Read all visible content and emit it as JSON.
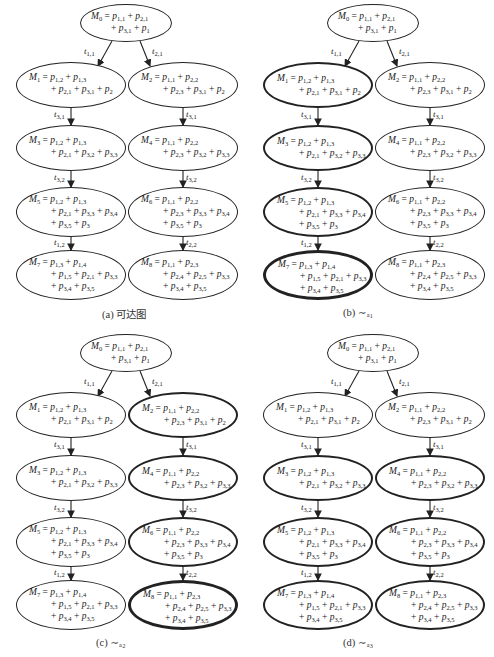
{
  "nodes": {
    "M0": {
      "line1": "M₀ = p₁,₁ + p₂,₁",
      "line2": "+ p₃,₁ + p₁"
    },
    "M1": {
      "line1": "M₁ = p₁,₂ + p₁,₃",
      "line2": "+ p₂,₁ + p₃,₁ + p₂"
    },
    "M2": {
      "line1": "M₂ = p₁,₁ + p₂,₂",
      "line2": "+ p₂,₃ + p₃,₁ + p₂"
    },
    "M3": {
      "line1": "M₃ = p₁,₂ + p₁,₃",
      "line2": "+ p₂,₁ + p₃,₂ + p₃,₃"
    },
    "M4": {
      "line1": "M₄ = p₁,₁ + p₂,₂",
      "line2": "+ p₂,₃ + p₃,₂ + p₃,₃"
    },
    "M5": {
      "line1": "M₅ = p₁,₂ + p₁,₃",
      "line2": "+ p₂,₁ + p₃,₃ + p₃,₄",
      "line3": "+ p₃,₅ + p₃"
    },
    "M6": {
      "line1": "M₆ = p₁,₁ + p₂,₂",
      "line2": "+ p₂,₃ + p₃,₃ + p₃,₄",
      "line3": "+ p₃,₅ + p₃"
    },
    "M7": {
      "line1": "M₇ = p₁,₃ + p₁,₄",
      "line2": "+ p₁,₅ + p₂,₁ + p₃,₃",
      "line3": "+ p₃,₄ + p₃,₅"
    },
    "M8": {
      "line1": "M₈ = p₁,₁ + p₂,₃",
      "line2": "+ p₂,₄ + p₂,₅ + p₃,₃",
      "line3": "+ p₃,₄ + p₃,₅"
    }
  },
  "edges": {
    "e01": "t₁,₁",
    "e02": "t₂,₁",
    "e13": "t₃,₁",
    "e24": "t₃,₁",
    "e35": "t₃,₂",
    "e46": "t₃,₂",
    "e57": "t₁,₂",
    "e68": "t₂,₂"
  },
  "panels": [
    {
      "id": "a",
      "caption": "(a) 可达图",
      "bold": []
    },
    {
      "id": "b",
      "caption": "(b) ∼ₐ₁",
      "bold": [
        "M1",
        "M3",
        "M5",
        "M7"
      ]
    },
    {
      "id": "c",
      "caption": "(c) ∼ₐ₂",
      "bold": [
        "M2",
        "M4",
        "M6",
        "M8"
      ]
    },
    {
      "id": "d",
      "caption": "(d) ∼ₐ₃",
      "bold": [
        "M3",
        "M4",
        "M5",
        "M6",
        "M7",
        "M8"
      ]
    }
  ]
}
